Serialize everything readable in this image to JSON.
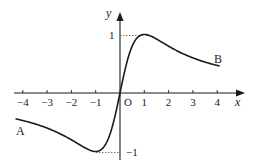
{
  "chart_data": {
    "type": "line",
    "title": "",
    "function": "y = 2x / (1 + x^2)",
    "xlabel": "x",
    "ylabel": "y",
    "origin_label": "O",
    "xlim": [
      -4.3,
      4.1
    ],
    "ylim": [
      -1,
      1
    ],
    "grid": false,
    "legend": "none",
    "x_ticks": [
      -4,
      -3,
      -2,
      -1,
      1,
      2,
      3,
      4
    ],
    "x_tick_labels": [
      "−4",
      "−3",
      "−2",
      "−1",
      "1",
      "2",
      "3",
      "4"
    ],
    "y_ticks": [
      1,
      -1
    ],
    "y_tick_labels": [
      "1",
      "−1"
    ],
    "series": [
      {
        "name": "curve AB",
        "x": [
          -4.3,
          -4,
          -3,
          -2,
          -1.5,
          -1,
          -0.5,
          0,
          0.5,
          1,
          1.5,
          2,
          3,
          4,
          4.1
        ],
        "values": [
          -0.44,
          -0.47,
          -0.6,
          -0.8,
          -0.92,
          -1,
          -0.8,
          0,
          0.8,
          1,
          0.92,
          0.8,
          0.6,
          0.47,
          0.46
        ]
      }
    ],
    "annotations": [
      {
        "text": "A",
        "x": -4.3,
        "y": -0.44,
        "note": "start point of curve"
      },
      {
        "text": "B",
        "x": 4.1,
        "y": 0.46,
        "note": "end point of curve"
      },
      {
        "text": "dotted guide",
        "from": [
          0,
          1
        ],
        "to": [
          1,
          1
        ]
      },
      {
        "text": "dotted guide",
        "from": [
          -1,
          -1
        ],
        "to": [
          0,
          -1
        ]
      }
    ],
    "colors": {
      "curve": "#1a1a1a",
      "axis": "#1a1a1a",
      "guide": "#555555"
    }
  },
  "labels": {
    "x_axis": "x",
    "y_axis": "y",
    "origin": "O",
    "point_a": "A",
    "point_b": "B",
    "y_one": "1",
    "y_minus_one": "−1",
    "x_ticks": [
      "−4",
      "−3",
      "−2",
      "−1",
      "1",
      "2",
      "3",
      "4"
    ]
  }
}
